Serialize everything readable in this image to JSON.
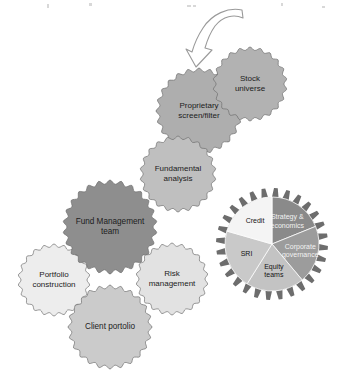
{
  "diagram": {
    "type": "process-gear-diagram",
    "background_color": "#ffffff",
    "arrow": {
      "name": "curved-down-arrow",
      "direction": "down-left",
      "style": "outline",
      "fill": "#ffffff",
      "stroke": "#9a9a9a"
    },
    "gears": [
      {
        "id": "stock-universe",
        "label_lines": [
          "Stock",
          "universe"
        ],
        "cx": 250,
        "cy": 84,
        "radius": 37,
        "teeth": 22,
        "fill": "#b2b2b2",
        "font_size": 8.0,
        "z": 4
      },
      {
        "id": "proprietary-screen-filter",
        "label_lines": [
          "Proprietary",
          "screen/filter"
        ],
        "cx": 199,
        "cy": 111,
        "radius": 43,
        "teeth": 24,
        "fill": "#aeaeae",
        "font_size": 8.0,
        "z": 3
      },
      {
        "id": "fundamental-analysis",
        "label_lines": [
          "Fundamental",
          "analysis"
        ],
        "cx": 178,
        "cy": 174,
        "radius": 38,
        "teeth": 22,
        "fill": "#bfbfbf",
        "font_size": 8.0,
        "z": 3
      },
      {
        "id": "fund-management-team",
        "label_lines": [
          "Fund Management",
          "team"
        ],
        "cx": 110,
        "cy": 227,
        "radius": 47,
        "teeth": 26,
        "fill": "#8e8e8e",
        "font_size": 8.2,
        "z": 6
      },
      {
        "id": "portfolio-construction",
        "label_lines": [
          "Portfolio",
          "construction"
        ],
        "cx": 54,
        "cy": 280,
        "radius": 36,
        "teeth": 22,
        "fill": "#ededed",
        "font_size": 8.0,
        "z": 2
      },
      {
        "id": "risk-management",
        "label_lines": [
          "Risk",
          "management"
        ],
        "cx": 172,
        "cy": 279,
        "radius": 36,
        "teeth": 22,
        "fill": "#e2e2e2",
        "font_size": 8.0,
        "z": 2
      },
      {
        "id": "client-portolio",
        "label_lines": [
          "Client portolio"
        ],
        "cx": 110,
        "cy": 327,
        "radius": 42,
        "teeth": 24,
        "fill": "#cbcbcb",
        "font_size": 8.2,
        "z": 1
      }
    ],
    "pie_gear": {
      "id": "pie-gear",
      "cx": 272,
      "cy": 244,
      "outer_radius": 56,
      "inner_radius": 47,
      "teeth": 28,
      "ring_fill": "#6d6d6d",
      "segments": [
        {
          "id": "strategy-economics",
          "label_lines": [
            "Strategy &",
            "economics"
          ],
          "start_angle": 0,
          "end_angle": 68,
          "fill": "#8a8a8a",
          "label_color": "light",
          "label_r": 0.58,
          "label_angle": 34
        },
        {
          "id": "corporate-governance",
          "label_lines": [
            "Corporate",
            "governance"
          ],
          "start_angle": 68,
          "end_angle": 140,
          "fill": "#9c9c9c",
          "label_color": "light",
          "label_r": 0.62,
          "label_angle": 104
        },
        {
          "id": "equity-teams",
          "label_lines": [
            "Equity",
            "teams"
          ],
          "start_angle": 140,
          "end_angle": 212,
          "fill": "#c3c3c3",
          "label_color": "dark",
          "label_r": 0.58,
          "label_angle": 176
        },
        {
          "id": "sri",
          "label_lines": [
            "SRI"
          ],
          "start_angle": 212,
          "end_angle": 286,
          "fill": "#c9c9c9",
          "label_color": "dark",
          "label_r": 0.58,
          "label_angle": 249
        },
        {
          "id": "credit",
          "label_lines": [
            "Credit"
          ],
          "start_angle": 286,
          "end_angle": 360,
          "fill": "#f4f4f4",
          "label_color": "dark",
          "label_r": 0.6,
          "label_angle": 323
        }
      ],
      "font_size": 7.0
    },
    "specks": [
      {
        "x": 47,
        "y": 4,
        "w": 2,
        "h": 4
      },
      {
        "x": 89,
        "y": 3,
        "w": 3,
        "h": 3
      },
      {
        "x": 187,
        "y": 5,
        "w": 4,
        "h": 2
      },
      {
        "x": 193,
        "y": 5,
        "w": 3,
        "h": 2
      },
      {
        "x": 281,
        "y": 3,
        "w": 2,
        "h": 3
      },
      {
        "x": 322,
        "y": 6,
        "w": 3,
        "h": 2
      }
    ]
  }
}
